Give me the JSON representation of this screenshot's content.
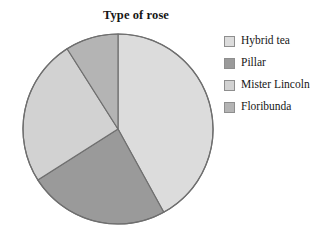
{
  "chart_data": {
    "type": "pie",
    "title": "Type of rose",
    "xlabel": "",
    "ylabel": "",
    "categories": [
      "Hybrid tea",
      "Pillar",
      "Mister Lincoln",
      "Floribunda"
    ],
    "values": [
      42,
      24,
      25,
      9
    ],
    "units": "percent",
    "start_angle_deg": 0,
    "direction": "clockwise",
    "legend_position": "right",
    "grid": false,
    "colors": [
      "#dcdcdc",
      "#9a9a9a",
      "#d2d2d2",
      "#b4b4b4"
    ],
    "slice_angles_deg": [
      151.2,
      86.4,
      90.0,
      32.4
    ],
    "outline_color": "#6f6f6f"
  },
  "legend": {
    "items": [
      {
        "label": "Hybrid tea",
        "color": "#dcdcdc"
      },
      {
        "label": "Pillar",
        "color": "#9a9a9a"
      },
      {
        "label": "Mister Lincoln",
        "color": "#d2d2d2"
      },
      {
        "label": "Floribunda",
        "color": "#b4b4b4"
      }
    ]
  }
}
